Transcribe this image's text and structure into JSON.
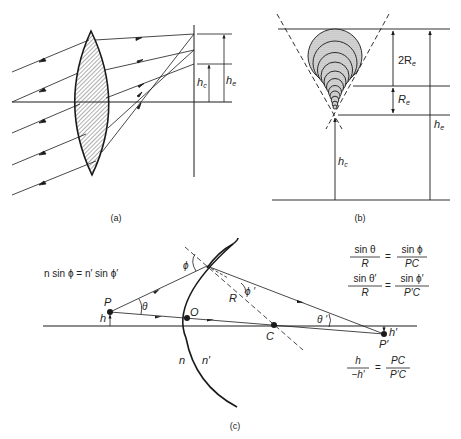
{
  "panels": {
    "a": {
      "caption": "(a)",
      "labels": {
        "hc": "h",
        "hc_sub": "c",
        "he": "h",
        "he_sub": "e"
      }
    },
    "b": {
      "caption": "(b)",
      "labels": {
        "two_re": "2R",
        "two_re_sub": "e",
        "re": "R",
        "re_sub": "e",
        "he": "h",
        "he_sub": "e",
        "hc": "h",
        "hc_sub": "c"
      }
    },
    "c": {
      "caption": "(c)",
      "points": {
        "P": "P",
        "O": "O",
        "C": "C",
        "P_prime": "P′"
      },
      "labels": {
        "h": "h",
        "h_prime": "h′",
        "n": "n",
        "n_prime": "n′",
        "R": "R",
        "phi": "ϕ",
        "phi_prime": "ϕ ′",
        "theta": "θ",
        "theta_prime": "θ ′"
      },
      "equations": {
        "snell": "n sin ϕ = n′ sin ϕ′",
        "eq1_num_left": "sin θ",
        "eq1_den_left": "R",
        "eq1_num_right": "sin ϕ",
        "eq1_den_right": "PC",
        "eq2_num_left": "sin θ′",
        "eq2_den_left": "R",
        "eq2_num_right": "sin ϕ′",
        "eq2_den_right": "P′C",
        "eq3_num_left": "h",
        "eq3_den_left": "−h′",
        "eq3_num_right": "PC",
        "eq3_den_right": "P′C",
        "equals": "="
      }
    }
  },
  "colors": {
    "ink": "#1a1a1a",
    "background": "#ffffff",
    "fill_gray": "#c8c8c8"
  }
}
